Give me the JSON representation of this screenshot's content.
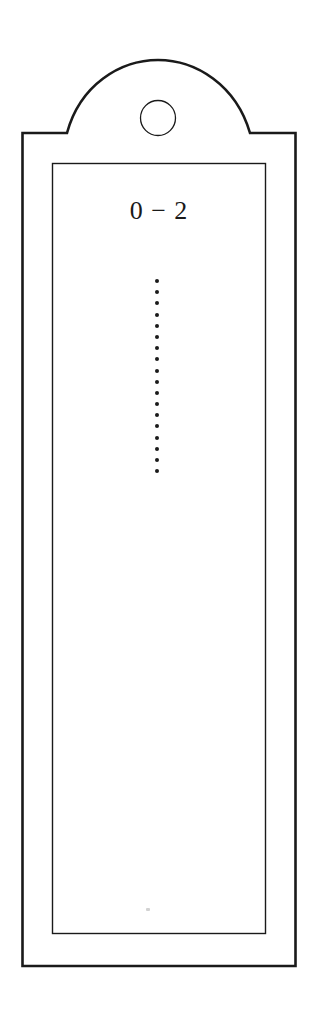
{
  "bookmark": {
    "label": "0 − 2",
    "dot_count": 18,
    "colors": {
      "background": "#ffffff",
      "stroke": "#1a1a1a"
    }
  }
}
